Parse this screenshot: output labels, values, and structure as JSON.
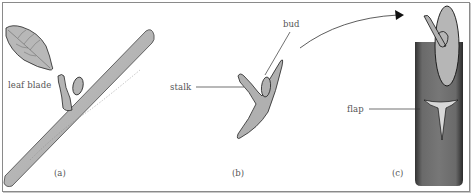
{
  "diagram": {
    "type": "botanical-illustration",
    "panels": [
      {
        "id": "a",
        "caption": "(a)",
        "labels": [
          "leaf blade"
        ]
      },
      {
        "id": "b",
        "caption": "(b)",
        "labels": [
          "stalk",
          "bud"
        ]
      },
      {
        "id": "c",
        "caption": "(c)",
        "labels": [
          "flap"
        ]
      }
    ],
    "colors": {
      "fill_light": "#b4b4b4",
      "fill_dark": "#6e6e6e",
      "outline": "#222222",
      "text": "#555555",
      "border": "#8a8a8a"
    }
  },
  "labels": {
    "leaf_blade": "leaf blade",
    "stalk": "stalk",
    "bud": "bud",
    "flap": "flap"
  },
  "captions": {
    "a": "(a)",
    "b": "(b)",
    "c": "(c)"
  }
}
